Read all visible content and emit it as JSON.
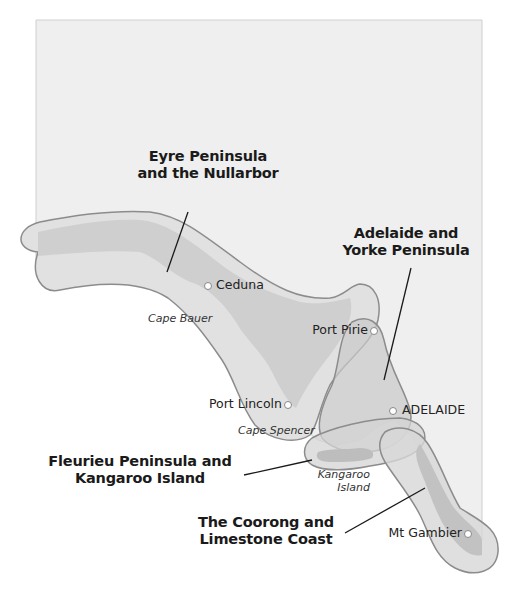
{
  "map": {
    "colors": {
      "background": "#ffffff",
      "land": "#efefef",
      "land_border": "#c8c8c8",
      "region_fill": "#d4d4d4",
      "region_inner": "#bcbcbc",
      "region_stroke": "#8c8c8c",
      "leader_line": "#1a1a1a",
      "town_marker": "#ffffff"
    },
    "regions": [
      {
        "id": "eyre",
        "label_line1": "Eyre Peninsula",
        "label_line2": "and the Nullarbor"
      },
      {
        "id": "adelaide-yorke",
        "label_line1": "Adelaide and",
        "label_line2": "Yorke Peninsula"
      },
      {
        "id": "fleurieu-kangaroo",
        "label_line1": "Fleurieu Peninsula and",
        "label_line2": "Kangaroo Island"
      },
      {
        "id": "coorong-limestone",
        "label_line1": "The Coorong and",
        "label_line2": "Limestone Coast"
      }
    ],
    "towns": [
      {
        "name": "Ceduna"
      },
      {
        "name": "Port Pirie"
      },
      {
        "name": "Port Lincoln"
      },
      {
        "name": "ADELAIDE"
      },
      {
        "name": "Mt Gambier"
      }
    ],
    "features": [
      {
        "name": "Cape Bauer"
      },
      {
        "name": "Cape Spencer"
      },
      {
        "name": "Kangaroo",
        "name_line2": "Island"
      }
    ]
  }
}
